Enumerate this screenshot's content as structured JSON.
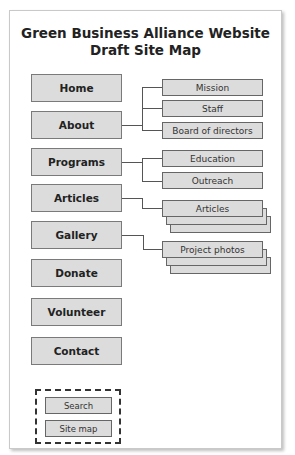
{
  "title": {
    "line1": "Green Business Alliance Website",
    "line2": "Draft Site Map"
  },
  "main_pages": [
    {
      "label": "Home"
    },
    {
      "label": "About"
    },
    {
      "label": "Programs"
    },
    {
      "label": "Articles"
    },
    {
      "label": "Gallery"
    },
    {
      "label": "Donate"
    },
    {
      "label": "Volunteer"
    },
    {
      "label": "Contact"
    }
  ],
  "sub_pages": {
    "about": [
      {
        "label": "Mission"
      },
      {
        "label": "Staff"
      },
      {
        "label": "Board of directors"
      }
    ],
    "programs": [
      {
        "label": "Education"
      },
      {
        "label": "Outreach"
      }
    ],
    "articles": [
      {
        "label": "Articles"
      }
    ],
    "gallery": [
      {
        "label": "Project photos"
      }
    ]
  },
  "utility_pages": [
    {
      "label": "Search"
    },
    {
      "label": "Site map"
    }
  ],
  "colors": {
    "box_fill": "#dcdcdc",
    "box_border": "#7a7a7a",
    "connector": "#555555"
  }
}
